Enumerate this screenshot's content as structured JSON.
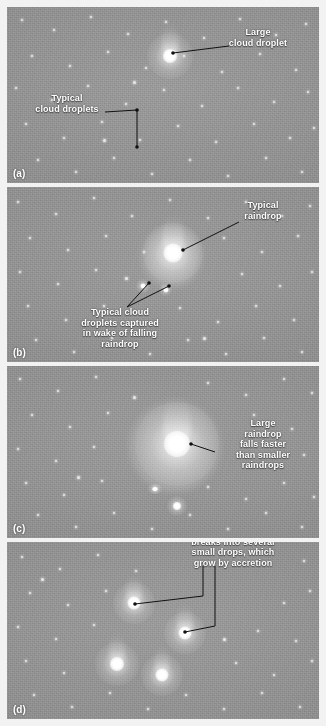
{
  "figure": {
    "background_color": "#8e8e8e",
    "text_color": "#ffffff",
    "leader_color": "#111111",
    "panels": [
      {
        "id": "a",
        "label": "(a)",
        "annotations": [
          {
            "name": "large-cloud-droplet",
            "text": "Large\ncloud droplet"
          },
          {
            "name": "typical-cloud-droplets",
            "text": "Typical\ncloud droplets"
          }
        ]
      },
      {
        "id": "b",
        "label": "(b)",
        "annotations": [
          {
            "name": "typical-raindrop",
            "text": "Typical\nraindrop"
          },
          {
            "name": "captured-cloud-droplets",
            "text": "Typical cloud\ndroplets captured\nin wake of falling\nraindrop"
          }
        ]
      },
      {
        "id": "c",
        "label": "(c)",
        "annotations": [
          {
            "name": "large-raindrop-speed",
            "text": "Large\nraindrop\nfalls faster\nthan smaller\nraindrops"
          }
        ]
      },
      {
        "id": "d",
        "label": "(d)",
        "annotations": [
          {
            "name": "raindrop-breakup",
            "text": "Large raindrop\nbreaks into several\nsmall drops, which\ngrow by accretion"
          }
        ]
      }
    ]
  }
}
